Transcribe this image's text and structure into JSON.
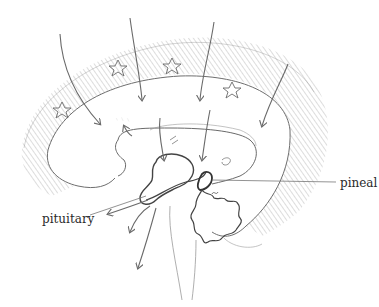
{
  "diagram": {
    "labels": [
      {
        "id": "pineal",
        "text": "pineal"
      },
      {
        "id": "pituitary",
        "text": "pituitary"
      }
    ],
    "colors": {
      "stroke": "#5a5a5a",
      "hatch": "#9a9a9a",
      "dark_stroke": "#333333",
      "background": "#ffffff"
    }
  }
}
